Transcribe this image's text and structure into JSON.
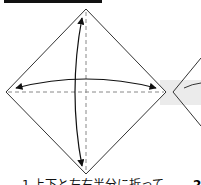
{
  "diagram": {
    "type": "origami-instruction",
    "step": {
      "number": "1",
      "caption": "上下と左右半分に折って"
    },
    "next_step": {
      "number": "2"
    },
    "shapes": {
      "square_as_diamond": {
        "top": [
          86,
          9
        ],
        "right": [
          166,
          92
        ],
        "bottom": [
          86,
          174
        ],
        "left": [
          6,
          92
        ]
      },
      "fold_lines": [
        "vertical-dashed",
        "horizontal-dashed"
      ],
      "arrows": [
        "vertical-double-headed-curved",
        "horizontal-double-headed-curved"
      ]
    },
    "colors": {
      "line": "#333333",
      "dashed": "#888888",
      "highlight_band": "#e8e8e8",
      "bar": "#111111"
    }
  }
}
